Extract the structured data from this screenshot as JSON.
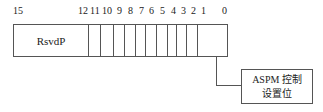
{
  "diagram": {
    "type": "register-bitfield",
    "bit_labels": [
      {
        "text": "15",
        "x": 13
      },
      {
        "text": "12",
        "x": 78
      },
      {
        "text": "11",
        "x": 90
      },
      {
        "text": "10",
        "x": 102
      },
      {
        "text": "9",
        "x": 117
      },
      {
        "text": "8",
        "x": 128
      },
      {
        "text": "7",
        "x": 139
      },
      {
        "text": "6",
        "x": 149
      },
      {
        "text": "5",
        "x": 160
      },
      {
        "text": "4",
        "x": 171
      },
      {
        "text": "3",
        "x": 181
      },
      {
        "text": "2",
        "x": 191
      },
      {
        "text": "1",
        "x": 201
      },
      {
        "text": "0",
        "x": 222
      }
    ],
    "fields": [
      {
        "name": "RsvdP",
        "bits": "15:12",
        "width": 76
      },
      {
        "name": "",
        "bits": "11",
        "width": 12
      },
      {
        "name": "",
        "bits": "10",
        "width": 13
      },
      {
        "name": "",
        "bits": "9",
        "width": 11
      },
      {
        "name": "",
        "bits": "8",
        "width": 11
      },
      {
        "name": "",
        "bits": "7",
        "width": 10
      },
      {
        "name": "",
        "bits": "6",
        "width": 11
      },
      {
        "name": "",
        "bits": "5",
        "width": 11
      },
      {
        "name": "",
        "bits": "4",
        "width": 10
      },
      {
        "name": "",
        "bits": "3",
        "width": 10
      },
      {
        "name": "",
        "bits": "2",
        "width": 11
      },
      {
        "name": "",
        "bits": "1:0",
        "width": 29
      }
    ],
    "callout": {
      "line1": "ASPM 控制",
      "line2": "设置位",
      "target_bits": "1:0"
    }
  }
}
